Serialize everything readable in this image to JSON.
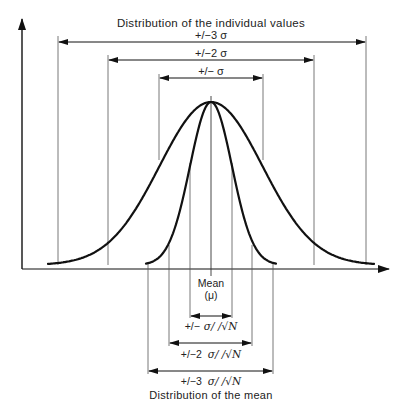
{
  "title_top": "Distribution of the individual values",
  "title_bottom": "Distribution of the mean",
  "mean_label": "Mean",
  "mean_symbol": "(μ)",
  "colors": {
    "ink": "#111111",
    "thin": "#555555",
    "text": "#222222",
    "background": "#ffffff"
  },
  "chart_data": {
    "type": "diagram",
    "curves": [
      {
        "name": "Distribution of the individual values",
        "sigma": 1.0,
        "shape": "normal"
      },
      {
        "name": "Distribution of the mean",
        "sigma": 0.41,
        "shape": "normal",
        "note": "sigma / sqrt(N)"
      }
    ],
    "individual_intervals": [
      {
        "label": "+/− σ",
        "k": 1
      },
      {
        "label": "+/−2 σ",
        "k": 2
      },
      {
        "label": "+/−3 σ",
        "k": 3
      }
    ],
    "mean_intervals": [
      {
        "label": "+/− σ/ /√N",
        "k": 1
      },
      {
        "label": "+/−2  σ/ /√N",
        "k": 2
      },
      {
        "label": "+/−3  σ/ /√N",
        "k": 3
      }
    ],
    "axes": {
      "x": "value (no ticks)",
      "y": "frequency (no ticks)",
      "grid": false
    }
  },
  "layout": {
    "center_x": 211,
    "baseline_y": 269,
    "peak_y": 102,
    "sigma_px": 51.5,
    "mean_sigma_px": 21.0,
    "curve_base_y": 265
  },
  "labels": {
    "sigma1": "+/− σ",
    "sigma2": "+/−2 σ",
    "sigma3": "+/−3 σ",
    "mean1_prefix": "+/−",
    "mean2_prefix": "+/−2",
    "mean3_prefix": "+/−3",
    "mean_suffix": "σ/ /√N"
  }
}
